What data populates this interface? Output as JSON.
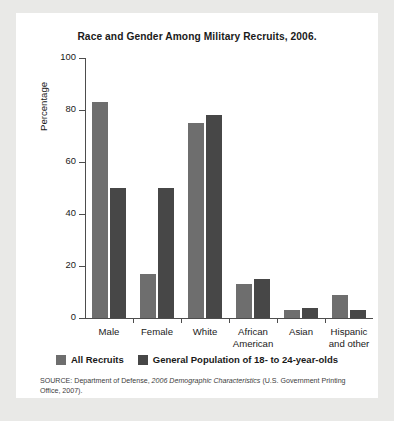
{
  "figure": {
    "title": "Race and Gender Among Military Recruits, 2006.",
    "source_prefix": "SOURCE: Department of Defense, ",
    "source_italic": "2006 Demographic Characteristics",
    "source_suffix": " (U.S. Government Printing Office, 2007)."
  },
  "colors": {
    "page_background": "#e9e9e7",
    "card_background": "#ffffff",
    "series_0": "#6e6e6e",
    "series_1": "#474747",
    "axis": "#4d4d4d",
    "text": "#1a1a1a"
  },
  "chart_data": {
    "type": "bar",
    "title": "Race and Gender Among Military Recruits, 2006.",
    "xlabel": "",
    "ylabel": "Percentage",
    "ylim": [
      0,
      100
    ],
    "yticks": [
      0,
      20,
      40,
      60,
      80,
      100
    ],
    "grid": false,
    "legend_position": "bottom",
    "categories": [
      "Male",
      "Female",
      "White",
      "African\nAmerican",
      "Asian",
      "Hispanic\nand other"
    ],
    "series": [
      {
        "name": "All Recruits",
        "color": "#6e6e6e",
        "values": [
          83,
          17,
          75,
          13,
          3,
          9
        ]
      },
      {
        "name": "General Population of 18- to 24-year-olds",
        "color": "#474747",
        "values": [
          50,
          50,
          78,
          15,
          4,
          3
        ]
      }
    ]
  }
}
